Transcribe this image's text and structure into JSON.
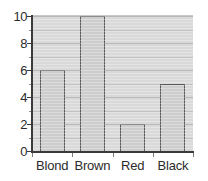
{
  "chart_data": {
    "type": "bar",
    "title": "",
    "subtitle": "",
    "xlabel": "",
    "ylabel": "",
    "categories": [
      "Blond",
      "Brown",
      "Red",
      "Black"
    ],
    "values": [
      6,
      10,
      2,
      5
    ],
    "series": [
      {
        "name": "Frequency",
        "values": [
          6,
          10,
          2,
          5
        ]
      }
    ],
    "ylim": [
      0,
      10
    ],
    "ytick_labels": [
      "0",
      "2",
      "4",
      "6",
      "8",
      "10"
    ],
    "ytick_values": [
      0,
      2,
      4,
      6,
      8,
      10
    ],
    "minor_ytick_values": [
      1,
      3,
      5,
      7,
      9
    ],
    "gridlines": {
      "horizontal_major": [
        2,
        4,
        6,
        8,
        10
      ],
      "horizontal_minor": [
        1,
        3,
        5,
        7,
        9
      ],
      "vertical": false
    },
    "grid": true,
    "legend": false,
    "legend_position": "none",
    "annotations": [],
    "colors": {
      "bar_fill": "#cdcdcd",
      "bar_border": "#5a5a5a",
      "plot_background": "#d9d9d9",
      "gridline_major": "#9a9a9a",
      "gridline_minor": "#c2c2c2",
      "axis": "#3a3a3a",
      "tick_label": "#2b2b2b",
      "page_background": "#ffffff"
    }
  }
}
